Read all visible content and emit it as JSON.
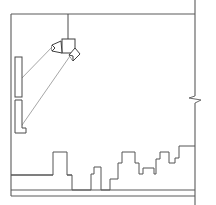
{
  "drawing": {
    "title": "Ceiling Spotlight Wall-Wash Elevation",
    "type": "line-drawing",
    "canvas": {
      "width": 216,
      "height": 205
    },
    "background_color": "#ffffff",
    "line_color": "#4a4a4a",
    "beam_color": "#8f8f8f",
    "frame_color": "#5a5a5a"
  },
  "frame": {
    "name": "room-section-frame",
    "left_x": 11,
    "right_x": 195,
    "ceiling_y": 14,
    "floor_y": 196,
    "right_edge_overshoot_top_y": 0,
    "right_edge_overshoot_bottom_y": 205
  },
  "fixture": {
    "name": "ceiling-spotlight",
    "stem_x": 68,
    "stem_top_y": 14,
    "stem_bottom_y": 40,
    "body": {
      "x": 62,
      "y": 39,
      "width": 13,
      "height": 14
    },
    "heads": [
      {
        "label": "head-left",
        "angle_deg": 225
      },
      {
        "label": "head-right",
        "angle_deg": 225
      }
    ]
  },
  "beams": [
    {
      "name": "beam-upper",
      "x1": 54,
      "y1": 45,
      "x2": 20,
      "y2": 80
    },
    {
      "name": "beam-lower",
      "x1": 70,
      "y1": 56,
      "x2": 20,
      "y2": 128
    }
  ],
  "wall_panels": [
    {
      "name": "wall-panel-upper",
      "x": 15,
      "y": 57,
      "width": 7,
      "height": 40
    },
    {
      "name": "wall-panel-lower",
      "x": 15,
      "y": 100,
      "width": 7,
      "height": 33
    },
    {
      "name": "wall-panel-lower-foot",
      "x": 15,
      "y": 128,
      "width": 11,
      "height": 5
    }
  ],
  "ground": {
    "name": "ground-platform",
    "plinth_top_y": 175,
    "plinth_bottom_y": 190,
    "plinth_left_x": 11,
    "plinth_right_x": 72
  },
  "skyline": {
    "name": "stepped-skyline",
    "description": "Stepped rectilinear silhouette of blocks rising from left to right",
    "points": "11,175 53,175 53,152 67,152 67,175 72,175 72,190 91,190 91,174 94,174 94,167 101,167 101,190 110,190 110,179 118,179 118,163 122,163 122,152 135,152 135,163 139,163 139,174 143,174 143,168 154,168 154,174 156,174 156,159 160,159 160,152 169,152 169,163 175,163 175,158 179,158 179,146 195,146"
  },
  "floor_lines": [
    {
      "name": "floor-line-main",
      "x1": 11,
      "y1": 190,
      "x2": 195,
      "y2": 190
    },
    {
      "name": "floor-line-base",
      "x1": 11,
      "y1": 196,
      "x2": 195,
      "y2": 196
    }
  ],
  "break_symbol": {
    "name": "break-line-symbol",
    "x": 195,
    "y": 98,
    "description": "Zigzag break mark on right vertical boundary"
  }
}
